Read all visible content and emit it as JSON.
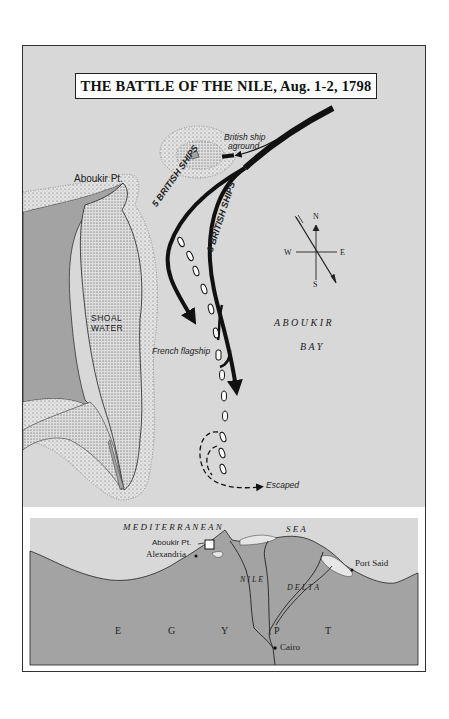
{
  "title": "THE BATTLE OF THE NILE, Aug. 1-2, 1798",
  "colors": {
    "sea": "#d8d8d8",
    "land": "#a3a3a3",
    "shoal": "#e2e2e2",
    "ink": "#111111",
    "paper": "#ffffff"
  },
  "main_map": {
    "labels": {
      "aboukir_pt": "Aboukir Pt.",
      "british_aground_line1": "British ship",
      "british_aground_line2": "aground",
      "five_british": "5 BRITISH SHIPS",
      "eight_british": "8 BRITISH SHIPS",
      "shoal_line1": "SHOAL",
      "shoal_line2": "WATER",
      "french_flagship": "French flagship",
      "bay_line1": "A B O U K I R",
      "bay_line2": "B A Y",
      "escaped": "Escaped"
    },
    "compass": {
      "n": "N",
      "s": "S",
      "e": "E",
      "w": "W"
    },
    "french_ship_count": 13
  },
  "inset_map": {
    "labels": {
      "sea_line": "M E D I T E R R A N E A N",
      "sea_word": "S E A",
      "aboukir_pt": "Aboukir Pt.",
      "alexandria": "Alexandria",
      "port_said": "Port Said",
      "nile": "N I L E",
      "delta": "D E L T A",
      "cairo": "Cairo",
      "egypt": [
        "E",
        "G",
        "Y",
        "P",
        "T"
      ]
    }
  }
}
